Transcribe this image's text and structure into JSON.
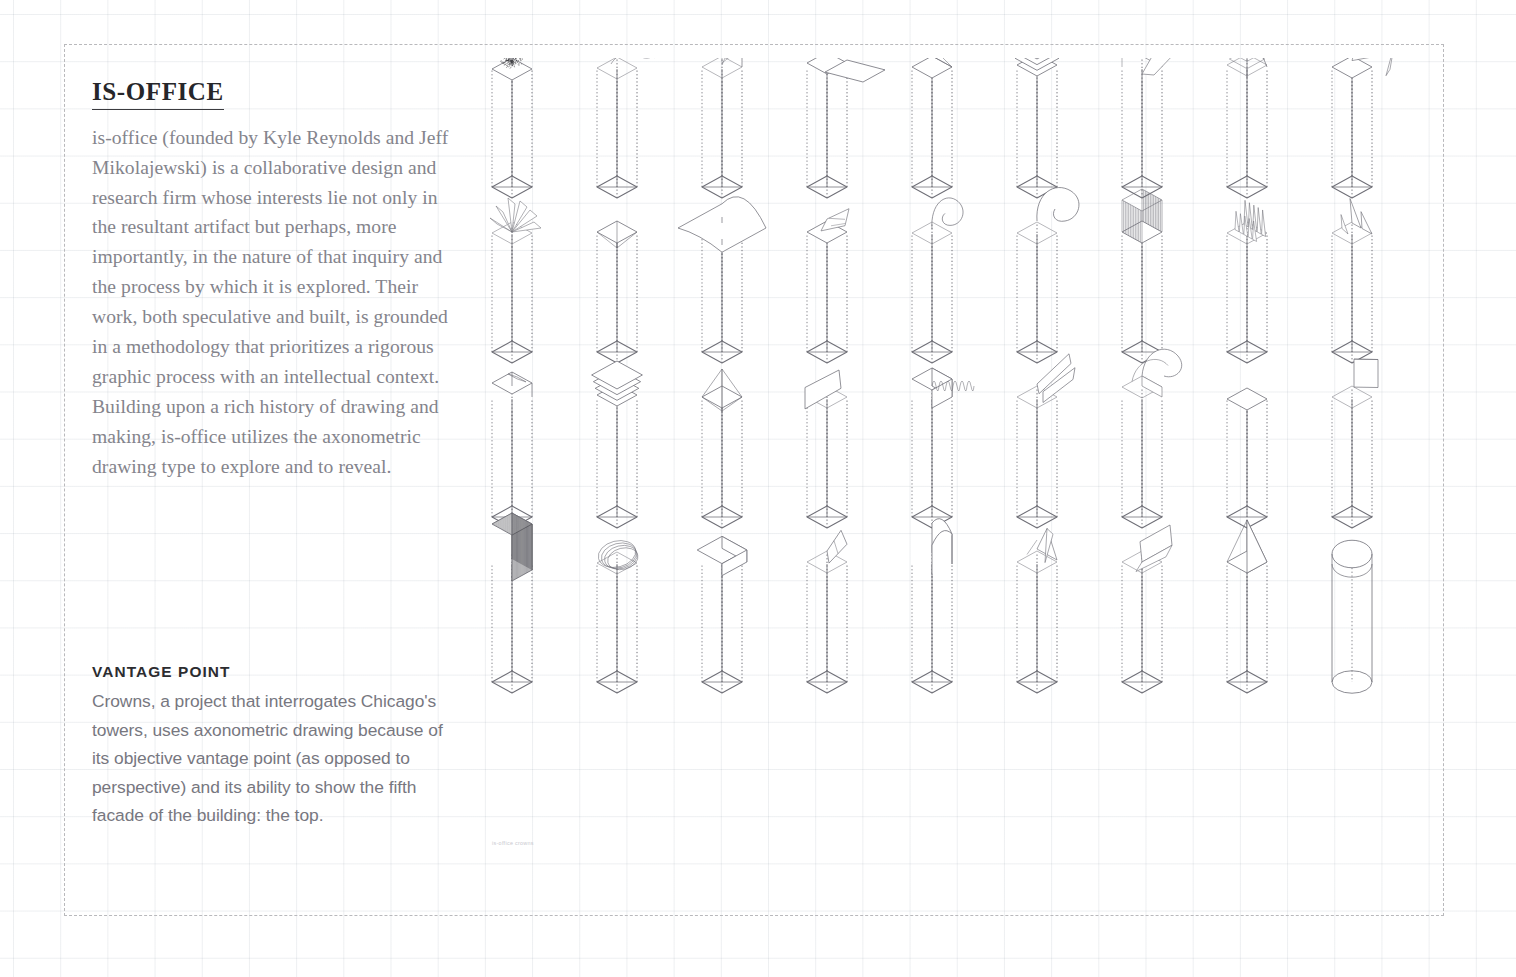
{
  "page": {
    "background_color": "#ffffff",
    "grid_color": "#bcc6cf",
    "frame_color": "#b9b9bc",
    "ink_color": "#6f6f77",
    "micro_caption": "is-office crowns"
  },
  "office": {
    "title": "IS-OFFICE",
    "body": "is-office (founded by Kyle Reynolds and Jeff Mikolajewski) is a collaborative design and research firm whose interests lie not only in the resultant artifact but perhaps, more importantly, in the nature of that inquiry and the process by which it is explored. Their work, both speculative and built, is grounded in a methodology that prioritizes a rigorous graphic process with an intellectual context. Building upon a rich history of drawing and making, is-office utilizes the axonometric drawing type to explore and to reveal.",
    "title_color": "#26262a",
    "body_color": "#84848c"
  },
  "vantage": {
    "title": "VANTAGE POINT",
    "body": "Crowns, a project that interrogates Chicago's towers, uses axonometric drawing because of its objective vantage point (as opposed to perspective) and its ability to show the fifth facade of the building: the top.",
    "title_color": "#2c2c30",
    "body_color": "#77777f"
  },
  "towers": {
    "rows": 4,
    "columns": 9,
    "count": 36,
    "column_spacing": 105,
    "row_spacing": 165,
    "origin_x": 28,
    "origin_y": 118,
    "shaft_half_width": 20,
    "shaft_depth": 11,
    "shaft_height": 118,
    "items": [
      {
        "index": 1,
        "row": 1,
        "col": 1,
        "crown": "scribble-mound",
        "label": "dense scribble mound"
      },
      {
        "index": 2,
        "row": 1,
        "col": 2,
        "crown": "curled-ribbon",
        "label": "curled ribbon cap"
      },
      {
        "index": 3,
        "row": 1,
        "col": 3,
        "crown": "twin-vault",
        "label": "twin barrel vault"
      },
      {
        "index": 4,
        "row": 1,
        "col": 4,
        "crown": "cantilever-slab",
        "label": "cantilevered slab"
      },
      {
        "index": 5,
        "row": 1,
        "col": 5,
        "crown": "antenna-star",
        "label": "antenna star spire"
      },
      {
        "index": 6,
        "row": 1,
        "col": 6,
        "crown": "stacked-plates",
        "label": "stacked plates"
      },
      {
        "index": 7,
        "row": 1,
        "col": 7,
        "crown": "folded-box",
        "label": "folded open box"
      },
      {
        "index": 8,
        "row": 1,
        "col": 8,
        "crown": "stepped-pyramid",
        "label": "concentric stepped pyramid"
      },
      {
        "index": 9,
        "row": 1,
        "col": 9,
        "crown": "bent-plank",
        "label": "bent plank cap"
      },
      {
        "index": 10,
        "row": 2,
        "col": 1,
        "crown": "shard-burst",
        "label": "shard burst"
      },
      {
        "index": 11,
        "row": 2,
        "col": 2,
        "crown": "inverted-cone",
        "label": "inverted cone void"
      },
      {
        "index": 13,
        "row": 2,
        "col": 3,
        "crown": "saddle-canopy",
        "label": "saddle canopy"
      },
      {
        "index": 14,
        "row": 2,
        "col": 4,
        "crown": "creased-wedge",
        "label": "creased wedge"
      },
      {
        "index": 15,
        "row": 2,
        "col": 5,
        "crown": "curl-scroll",
        "label": "scrolled curl"
      },
      {
        "index": 16,
        "row": 2,
        "col": 6,
        "crown": "peel-wave",
        "label": "peeling wave"
      },
      {
        "index": 17,
        "row": 2,
        "col": 7,
        "crown": "comb-fins",
        "label": "comb fins"
      },
      {
        "index": 18,
        "row": 2,
        "col": 8,
        "crown": "crystal-teeth",
        "label": "crystal teeth"
      },
      {
        "index": 19,
        "row": 2,
        "col": 9,
        "crown": "split-peaks",
        "label": "split peaks"
      },
      {
        "index": 20,
        "row": 3,
        "col": 1,
        "crown": "notched-cap",
        "label": "notched cap"
      },
      {
        "index": 21,
        "row": 3,
        "col": 2,
        "crown": "stacked-plates",
        "label": "stacked plates"
      },
      {
        "index": 22,
        "row": 3,
        "col": 3,
        "crown": "diamond-cage",
        "label": "diamond cage"
      },
      {
        "index": 23,
        "row": 3,
        "col": 4,
        "crown": "leaning-slab",
        "label": "leaning slab"
      },
      {
        "index": 24,
        "row": 3,
        "col": 5,
        "crown": "drip-block",
        "label": "dripping block"
      },
      {
        "index": 25,
        "row": 3,
        "col": 6,
        "crown": "double-flap",
        "label": "double tilted flap"
      },
      {
        "index": 26,
        "row": 3,
        "col": 7,
        "crown": "rolled-mass",
        "label": "rolled mass"
      },
      {
        "index": 27,
        "row": 3,
        "col": 8,
        "crown": "plain-prism",
        "label": "plain closed prism"
      },
      {
        "index": 28,
        "row": 3,
        "col": 9,
        "crown": "blade-fin",
        "label": "blade fin"
      },
      {
        "index": 29,
        "row": 4,
        "col": 1,
        "crown": "hatched-cube",
        "label": "hatched cube"
      },
      {
        "index": 30,
        "row": 4,
        "col": 2,
        "crown": "ring-halo",
        "label": "ring halo"
      },
      {
        "index": 31,
        "row": 4,
        "col": 3,
        "crown": "pillow-cap",
        "label": "pillow cap"
      },
      {
        "index": 32,
        "row": 4,
        "col": 4,
        "crown": "sliced-wedge",
        "label": "sliced wedge"
      },
      {
        "index": 33,
        "row": 4,
        "col": 5,
        "crown": "barrel-arch",
        "label": "barrel arch"
      },
      {
        "index": 34,
        "row": 4,
        "col": 6,
        "crown": "zig-crest",
        "label": "zigzag crest"
      },
      {
        "index": 35,
        "row": 4,
        "col": 7,
        "crown": "tilted-prism",
        "label": "tilted prism"
      },
      {
        "index": 36,
        "row": 4,
        "col": 8,
        "crown": "pyramid-spire",
        "label": "pyramid spire"
      },
      {
        "index": 37,
        "row": 4,
        "col": 9,
        "crown": "cylinder-dome",
        "label": "cylindrical shaft with dome"
      }
    ]
  }
}
